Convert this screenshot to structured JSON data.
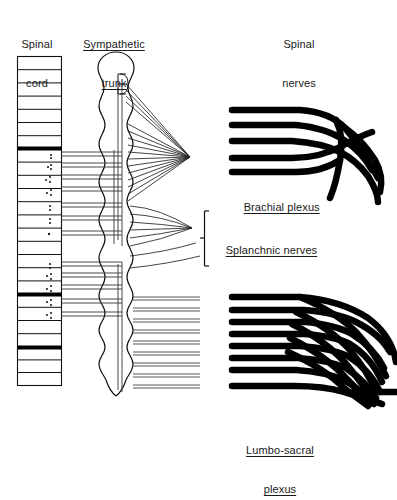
{
  "figure": {
    "background": "#ffffff",
    "ink": "#000000",
    "thin_ink": "#333333"
  },
  "labels": {
    "spinal_cord": {
      "line1": "Spinal",
      "line2": "cord",
      "underlined": false,
      "x": 12,
      "y": 14
    },
    "sympathetic_trunk": {
      "line1": "Sympathetic",
      "line2": "trunk",
      "underlined": true,
      "x": 73,
      "y": 14
    },
    "spinal_nerves": {
      "line1": "Spinal",
      "line2": "nerves",
      "underlined": false,
      "x": 272,
      "y": 14
    },
    "brachial_plexus": {
      "text": "Brachial plexus",
      "underlined": true,
      "x": 232,
      "y": 190
    },
    "splanchnic_nerves": {
      "text": "Splanchnic nerves",
      "underlined": true,
      "x": 214,
      "y": 232
    },
    "lumbo_sacral_plexus": {
      "line1": "Lumbo-sacral",
      "line2": "plexus",
      "underlined": true,
      "x": 240,
      "y": 420
    }
  },
  "spinal_cord": {
    "name": "spinal-cord-ladder",
    "x": 17,
    "y": 56,
    "width": 45,
    "height": 330,
    "segment_count": 25,
    "thick_bars_at_segments": [
      8,
      17,
      22
    ],
    "dotted_segments": [
      9,
      10,
      11,
      12,
      13,
      14,
      15,
      16,
      18,
      19,
      20
    ]
  },
  "sympathetic_trunk": {
    "name": "sympathetic-trunk-chain",
    "x_left": 98,
    "x_right": 135,
    "y_top": 52,
    "y_bottom": 396,
    "head_radius": 17,
    "ganglion_count": 22
  },
  "rami": {
    "name": "communicating-rami",
    "upper_group_y": [
      152,
      162,
      172,
      182,
      192,
      202,
      212,
      222
    ],
    "lower_group_y": [
      262,
      272,
      282,
      292
    ],
    "x_from": 62,
    "x_to": 118
  },
  "cervical_fan": {
    "name": "cervical-nerve-fan",
    "converge_x": 190,
    "converge_y": 157,
    "origin_x": 124,
    "origin_ys": [
      84,
      90,
      96,
      102,
      124,
      132,
      140,
      148,
      156,
      164,
      172,
      180,
      188,
      196,
      204
    ]
  },
  "splanchnic_fan": {
    "name": "splanchnic-nerve-fan",
    "converge_x": 192,
    "converge_y": 228,
    "origin_x": 128,
    "origin_ys": [
      206,
      214,
      222,
      230,
      238,
      246
    ],
    "lower_strays": [
      252,
      262
    ]
  },
  "splanchnic_bracket": {
    "name": "splanchnic-bracket",
    "x": 204,
    "y_top": 211,
    "y_bottom": 266,
    "tick_y": 238
  },
  "lumbar_rays": {
    "name": "lumbar-spinal-nerve-rays",
    "x_from": 133,
    "x_to": 196,
    "ys": [
      297,
      307,
      317,
      327,
      337,
      347,
      357,
      367,
      377,
      387
    ]
  },
  "brachial_plexus": {
    "name": "brachial-plexus-drawing",
    "type": "nerve-plexus",
    "root_count": 5,
    "root_x_start": 232,
    "root_ys": [
      110,
      124,
      140,
      157,
      170
    ],
    "merge_x": 330,
    "trunk_y": 150,
    "exit_x": 380
  },
  "lumbosacral_plexus": {
    "name": "lumbosacral-plexus-drawing",
    "type": "nerve-plexus",
    "root_count": 8,
    "root_x_start": 232,
    "root_ys": [
      298,
      310,
      322,
      334,
      346,
      358,
      370,
      386
    ],
    "merge_x": 352,
    "exit_x": 392,
    "exit_y": 400
  }
}
